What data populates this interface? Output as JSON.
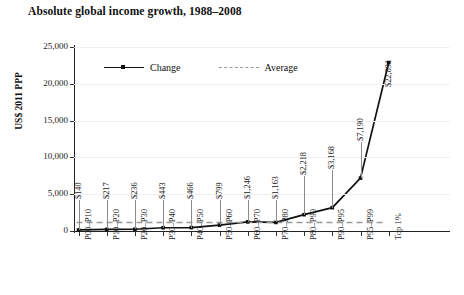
{
  "chart_data": {
    "type": "line",
    "title": "Absolute global income growth, 1988–2008",
    "xlabel": "",
    "ylabel": "US$ 2011 PPP",
    "ylim": [
      0,
      25000
    ],
    "yticks": [
      0,
      5000,
      10000,
      15000,
      20000,
      25000
    ],
    "ytick_labels": [
      "0",
      "5,000",
      "10,000",
      "15,000",
      "20,000",
      "25,000"
    ],
    "grid": true,
    "legend_position": "top-left-inside",
    "categories": [
      "P00–P10",
      "P10–P20",
      "P20–P30",
      "P30–P40",
      "P40–P50",
      "P50–P60",
      "P60–P70",
      "P70–P80",
      "P80–P90",
      "P90–P95",
      "P95–P99",
      "Top 1%"
    ],
    "series": [
      {
        "name": "Change",
        "style": "solid",
        "color": "#111111",
        "values": [
          140,
          217,
          236,
          443,
          466,
          799,
          1246,
          1163,
          2218,
          3168,
          7190,
          22891
        ],
        "data_labels": [
          "$140",
          "$217",
          "$236",
          "$443",
          "$466",
          "$799",
          "$1,246",
          "$1,163",
          "$2,218",
          "$3,168",
          "$7,190",
          "$22,891"
        ]
      },
      {
        "name": "Average",
        "style": "dashed",
        "color": "#9a9a9a",
        "value": 1150
      }
    ]
  },
  "legend": {
    "items": [
      {
        "label": "Change"
      },
      {
        "label": "Average"
      }
    ]
  }
}
